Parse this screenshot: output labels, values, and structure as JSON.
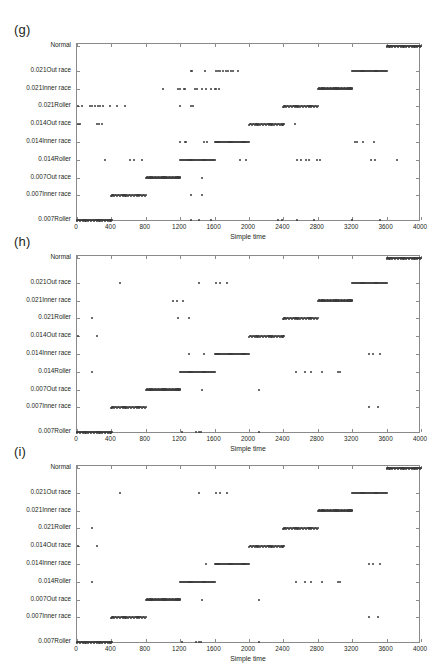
{
  "figure": {
    "panels": [
      {
        "key": "g",
        "label": "(g)"
      },
      {
        "key": "h",
        "label": "(h)"
      },
      {
        "key": "i",
        "label": "(i)"
      }
    ]
  },
  "chart_data": [
    {
      "type": "scatter",
      "title": "(g)",
      "xlabel": "Simple time",
      "ylabel": "",
      "xlim": [
        0,
        4000
      ],
      "xticks": [
        0,
        400,
        800,
        1200,
        1600,
        2000,
        2400,
        2800,
        3200,
        3600,
        4000
      ],
      "xticklabels": [
        "0",
        "400",
        "800",
        "1200",
        "1600",
        "2000",
        "2400",
        "2800",
        "3200",
        "3600",
        "4000"
      ],
      "categories": [
        "Normal",
        "0.021Out race",
        "0.021Inner race",
        "0.021Roller",
        "0.014Out race",
        "0.014Inner race",
        "0.014Roller",
        "0.007Out race",
        "0.007Inner race",
        "0.007Roller"
      ],
      "grid": false,
      "legend": "none",
      "marker_color": "#3b3b3b",
      "series": [
        {
          "name": "Normal",
          "bands": [
            [
              3600,
              4000
            ]
          ],
          "outliers": []
        },
        {
          "name": "0.021Out race",
          "bands": [
            [
              3200,
              3600
            ]
          ],
          "outliers": [
            1320,
            1335,
            1490,
            1620,
            1640,
            1660,
            1700,
            1730,
            1760,
            1790,
            1810,
            1870
          ]
        },
        {
          "name": "0.021Inner race",
          "bands": [
            [
              2800,
              3200
            ]
          ],
          "outliers": [
            1000,
            1180,
            1200,
            1240,
            1260,
            1370,
            1400,
            1450,
            1500,
            1560,
            1600,
            1620,
            1650
          ]
        },
        {
          "name": "0.021Roller",
          "bands": [
            [
              2400,
              2800
            ]
          ],
          "outliers": [
            10,
            60,
            150,
            170,
            210,
            240,
            270,
            300,
            380,
            470,
            560,
            1200,
            1330,
            1350
          ]
        },
        {
          "name": "0.014Out race",
          "bands": [
            [
              2000,
              2400
            ]
          ],
          "outliers": [
            10,
            40,
            230,
            250,
            290,
            2540
          ]
        },
        {
          "name": "0.014Inner race",
          "bands": [
            [
              1600,
              2000
            ]
          ],
          "outliers": [
            1200,
            1250,
            1270,
            1480,
            1510,
            3230,
            3250,
            3330,
            3450
          ]
        },
        {
          "name": "0.014Roller",
          "bands": [
            [
              1200,
              1600
            ]
          ],
          "outliers": [
            330,
            620,
            660,
            760,
            1900,
            1960,
            2560,
            2600,
            2660,
            2700,
            2790,
            2820,
            3420,
            3460,
            3720
          ]
        },
        {
          "name": "0.007Out race",
          "bands": [
            [
              800,
              1200
            ]
          ],
          "outliers": [
            1450
          ]
        },
        {
          "name": "0.007Inner race",
          "bands": [
            [
              400,
              800
            ]
          ],
          "outliers": [
            1320,
            1450
          ]
        },
        {
          "name": "0.007Roller",
          "bands": [
            [
              0,
              400
            ]
          ],
          "outliers": [
            1330,
            1420,
            1560,
            2340,
            2380,
            2560,
            2760,
            3200,
            3520
          ]
        }
      ]
    },
    {
      "type": "scatter",
      "title": "(h)",
      "xlabel": "Simple time",
      "ylabel": "",
      "xlim": [
        0,
        4000
      ],
      "xticks": [
        0,
        400,
        800,
        1200,
        1600,
        2000,
        2400,
        2800,
        3200,
        3600,
        4000
      ],
      "xticklabels": [
        "0",
        "400",
        "800",
        "1200",
        "1600",
        "2000",
        "2400",
        "2800",
        "3200",
        "3600",
        "4000"
      ],
      "categories": [
        "Normal",
        "0.021Out race",
        "0.021Inner race",
        "0.021Roller",
        "0.014Out race",
        "0.014Inner race",
        "0.014Roller",
        "0.007Out race",
        "0.007Inner race",
        "0.007Roller"
      ],
      "grid": false,
      "legend": "none",
      "marker_color": "#3b3b3b",
      "series": [
        {
          "name": "Normal",
          "bands": [
            [
              3600,
              4000
            ]
          ],
          "outliers": []
        },
        {
          "name": "0.021Out race",
          "bands": [
            [
              3200,
              3600
            ]
          ],
          "outliers": [
            500,
            1420,
            1620,
            1660,
            1740
          ]
        },
        {
          "name": "0.021Inner race",
          "bands": [
            [
              2800,
              3200
            ]
          ],
          "outliers": [
            1120,
            1160,
            1230
          ]
        },
        {
          "name": "0.021Roller",
          "bands": [
            [
              2400,
              2800
            ]
          ],
          "outliers": [
            180,
            1180,
            1300
          ]
        },
        {
          "name": "0.014Out race",
          "bands": [
            [
              2000,
              2400
            ]
          ],
          "outliers": [
            10,
            230
          ]
        },
        {
          "name": "0.014Inner race",
          "bands": [
            [
              1600,
              2000
            ]
          ],
          "outliers": [
            1300,
            1480,
            3400,
            3440,
            3520
          ]
        },
        {
          "name": "0.014Roller",
          "bands": [
            [
              1200,
              1600
            ]
          ],
          "outliers": [
            180,
            2550,
            2650,
            2720,
            2850,
            3030,
            3060
          ]
        },
        {
          "name": "0.007Out race",
          "bands": [
            [
              800,
              1200
            ]
          ],
          "outliers": [
            1450,
            2120
          ]
        },
        {
          "name": "0.007Inner race",
          "bands": [
            [
              400,
              800
            ]
          ],
          "outliers": [
            3400,
            3500
          ]
        },
        {
          "name": "0.007Roller",
          "bands": [
            [
              0,
              400
            ]
          ],
          "outliers": [
            1220,
            1380,
            1420,
            1440,
            2120
          ]
        }
      ]
    },
    {
      "type": "scatter",
      "title": "(i)",
      "xlabel": "Simple time",
      "ylabel": "",
      "xlim": [
        0,
        4000
      ],
      "xticks": [
        0,
        400,
        800,
        1200,
        1600,
        2000,
        2400,
        2800,
        3200,
        3600,
        4000
      ],
      "xticklabels": [
        "0",
        "400",
        "800",
        "1200",
        "1600",
        "2000",
        "2400",
        "2800",
        "3200",
        "3600",
        "4000"
      ],
      "categories": [
        "Normal",
        "0.021Out race",
        "0.021Inner race",
        "0.021Roller",
        "0.014Out race",
        "0.014Inner race",
        "0.014Roller",
        "0.007Out race",
        "0.007Inner race",
        "0.007Roller"
      ],
      "grid": false,
      "legend": "none",
      "marker_color": "#3b3b3b",
      "series": [
        {
          "name": "Normal",
          "bands": [
            [
              3600,
              4000
            ]
          ],
          "outliers": []
        },
        {
          "name": "0.021Out race",
          "bands": [
            [
              3200,
              3600
            ]
          ],
          "outliers": [
            500,
            1420,
            1620,
            1660,
            1740
          ]
        },
        {
          "name": "0.021Inner race",
          "bands": [
            [
              2800,
              3200
            ]
          ],
          "outliers": []
        },
        {
          "name": "0.021Roller",
          "bands": [
            [
              2400,
              2800
            ]
          ],
          "outliers": [
            180
          ]
        },
        {
          "name": "0.014Out race",
          "bands": [
            [
              2000,
              2400
            ]
          ],
          "outliers": [
            10,
            230
          ]
        },
        {
          "name": "0.014Inner race",
          "bands": [
            [
              1600,
              2000
            ]
          ],
          "outliers": [
            1500,
            3400,
            3440,
            3520
          ]
        },
        {
          "name": "0.014Roller",
          "bands": [
            [
              1200,
              1600
            ]
          ],
          "outliers": [
            180,
            2550,
            2650,
            2720,
            2850,
            3030,
            3060
          ]
        },
        {
          "name": "0.007Out race",
          "bands": [
            [
              800,
              1200
            ]
          ],
          "outliers": [
            1450,
            2120
          ]
        },
        {
          "name": "0.007Inner race",
          "bands": [
            [
              400,
              800
            ]
          ],
          "outliers": [
            3400,
            3500
          ]
        },
        {
          "name": "0.007Roller",
          "bands": [
            [
              0,
              400
            ]
          ],
          "outliers": [
            1220,
            1380,
            1420,
            1440,
            2120
          ]
        }
      ]
    }
  ]
}
